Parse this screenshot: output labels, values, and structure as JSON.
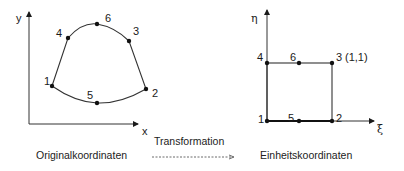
{
  "left_diagram": {
    "axis_x_label": "x",
    "axis_y_label": "y",
    "points": [
      {
        "label": "1",
        "x": 52,
        "y": 86
      },
      {
        "label": "2",
        "x": 146,
        "y": 89
      },
      {
        "label": "3",
        "x": 129,
        "y": 41
      },
      {
        "label": "4",
        "x": 68,
        "y": 38
      },
      {
        "label": "5",
        "x": 97,
        "y": 102
      },
      {
        "label": "6",
        "x": 97,
        "y": 24
      }
    ],
    "caption": "Originalkoordinaten"
  },
  "right_diagram": {
    "axis_x_label": "ξ",
    "axis_y_label": "η",
    "points": [
      {
        "label": "1",
        "x": 267,
        "y": 121
      },
      {
        "label": "2",
        "x": 332,
        "y": 121
      },
      {
        "label": "3",
        "x": 332,
        "y": 63
      },
      {
        "label": "4",
        "x": 267,
        "y": 63
      },
      {
        "label": "5",
        "x": 299,
        "y": 121
      },
      {
        "label": "6",
        "x": 299,
        "y": 63
      }
    ],
    "corner_annotation": "(1,1)",
    "caption": "Einheitskoordinaten"
  },
  "transformation": {
    "label": "Transformation"
  }
}
